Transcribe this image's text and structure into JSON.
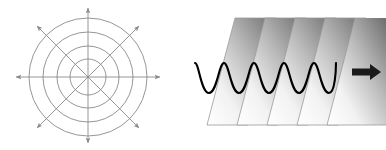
{
  "figure": {
    "background_color": "#ffffff",
    "panel_count": 2
  },
  "panels": [
    {
      "id": "spherical-wave",
      "name": "Spherical wave / isotropic radiation diagram",
      "description": "Concentric circular wavefronts with eight arrows radiating outward from a common center point",
      "center": {
        "x": 88,
        "y": 77
      },
      "stroke_color": "#8a8a8a",
      "stroke_width": 0.9,
      "circle_count": 4,
      "circle_radii": [
        18,
        31,
        45,
        59
      ],
      "arrow_count": 8,
      "arrow_length": 74,
      "arrow_angles_deg": [
        0,
        45,
        90,
        135,
        180,
        225,
        270,
        315
      ],
      "arrow_labels": [
        "arrow-east",
        "arrow-northeast",
        "arrow-north",
        "arrow-northwest",
        "arrow-west",
        "arrow-southwest",
        "arrow-south",
        "arrow-southeast"
      ]
    },
    {
      "id": "plane-wave",
      "name": "Plane wave diagram",
      "description": "Five parallel gradient-shaded wavefront planes drawn in perspective with a sine wave passing through them and a propagation direction arrow",
      "plane_count": 5,
      "plane_labels": [
        "wavefront-plane-1",
        "wavefront-plane-2",
        "wavefront-plane-3",
        "wavefront-plane-4",
        "wavefront-plane-5"
      ],
      "plane_outline_color": "#9a9a9a",
      "plane_gradient_light": "#ffffff",
      "plane_gradient_dark": "#6e6e6e",
      "plane_first_left_x": 14,
      "plane_spacing_x": 30,
      "plane_width": 41,
      "plane_skew_dx": 28,
      "plane_top_y": 18,
      "plane_bottom_y": 125,
      "wave": {
        "name": "sine-wave",
        "color": "#000000",
        "stroke_width": 2.1,
        "cycles": 5,
        "amplitude": 15,
        "baseline_y": 78,
        "start_x": 2,
        "end_x": 143
      },
      "propagation_arrow": {
        "name": "propagation-arrow",
        "direction": "right",
        "color": "#1a1a1a",
        "shaft_y": 72,
        "shaft_start_x": 159,
        "shaft_end_x": 178,
        "tip_x": 187
      }
    }
  ]
}
